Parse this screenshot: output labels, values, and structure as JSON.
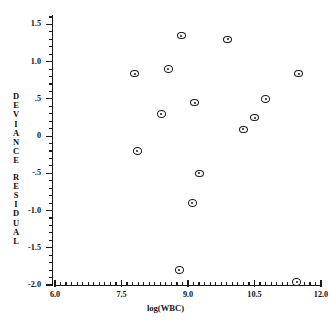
{
  "chart_data": {
    "type": "scatter",
    "title": "",
    "xlabel": "log(WBC)",
    "ylabel": "DEVIANCE RESIDUAL",
    "xlim": [
      6.0,
      12.0
    ],
    "ylim": [
      -2.0,
      1.6
    ],
    "grid": false,
    "legend": null,
    "x_ticks": [
      "6.0",
      "7.5",
      "9.0",
      "10.5",
      "12.0"
    ],
    "x_tick_values": [
      6.0,
      7.5,
      9.0,
      10.5,
      12.0
    ],
    "y_ticks": [
      "1.5",
      "1.0",
      ".5",
      "0",
      "-.5",
      "-1.0",
      "-1.5",
      "-2.0"
    ],
    "y_tick_values": [
      1.5,
      1.0,
      0.5,
      0,
      -0.5,
      -1.0,
      -1.5,
      -2.0
    ],
    "x_minor_interval": 0.125,
    "y_minor_interval": 0.1,
    "marker": "circle-with-center-dot",
    "points": [
      {
        "x": 8.85,
        "y": 1.35
      },
      {
        "x": 9.9,
        "y": 1.3
      },
      {
        "x": 7.8,
        "y": 0.84
      },
      {
        "x": 8.55,
        "y": 0.9
      },
      {
        "x": 11.5,
        "y": 0.84
      },
      {
        "x": 9.15,
        "y": 0.45
      },
      {
        "x": 10.75,
        "y": 0.5
      },
      {
        "x": 8.4,
        "y": 0.3
      },
      {
        "x": 10.5,
        "y": 0.25
      },
      {
        "x": 10.25,
        "y": 0.09
      },
      {
        "x": 7.85,
        "y": -0.2
      },
      {
        "x": 9.25,
        "y": -0.5
      },
      {
        "x": 9.1,
        "y": -0.9
      },
      {
        "x": 8.8,
        "y": -1.8
      },
      {
        "x": 11.45,
        "y": -1.96
      }
    ]
  },
  "y_axis_title_chars": [
    "D",
    "E",
    "V",
    "I",
    "A",
    "N",
    "C",
    "E",
    "",
    "R",
    "E",
    "S",
    "I",
    "D",
    "U",
    "A",
    "L"
  ]
}
